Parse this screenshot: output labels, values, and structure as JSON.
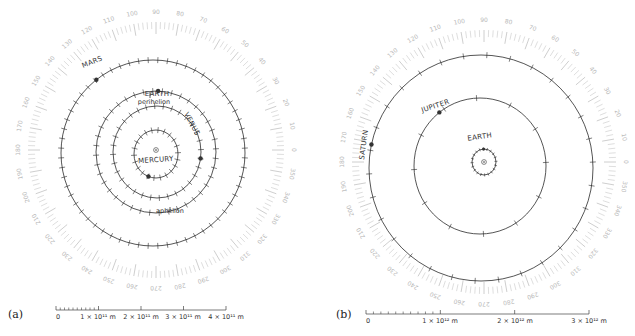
{
  "figure": {
    "panels": [
      {
        "id": "a",
        "panel_label": "(a)",
        "center": [
          156,
          150
        ],
        "degree_ring": {
          "inner_radius": 118,
          "outer_radius": 128,
          "label_radius": 138,
          "label_step_deg": 10,
          "labels": [
            "0",
            "10",
            "20",
            "30",
            "40",
            "50",
            "60",
            "70",
            "80",
            "90",
            "100",
            "110",
            "120",
            "130",
            "140",
            "150",
            "160",
            "170",
            "180",
            "190",
            "200",
            "210",
            "220",
            "230",
            "240",
            "250",
            "260",
            "270",
            "280",
            "290",
            "300",
            "310",
            "320",
            "330",
            "340",
            "350"
          ]
        },
        "orbits": [
          {
            "name": "MERCURY",
            "rx": 22,
            "ry": 24,
            "cx_off": 0,
            "cy_off": 4,
            "ticks": 22,
            "planet_angle_deg": 250,
            "label": "MERCURY",
            "label_pos": [
              156,
              162
            ]
          },
          {
            "name": "VENUS",
            "rx": 44,
            "ry": 46,
            "cx_off": 1,
            "cy_off": 2,
            "ticks": 32,
            "planet_angle_deg": -8,
            "label": "VENUS",
            "label_pos": [
              190,
              125
            ]
          },
          {
            "name": "EARTH",
            "rx": 60,
            "ry": 61,
            "cx_off": 0,
            "cy_off": 2,
            "ticks": 40,
            "planet_angle_deg": 88,
            "label": "EARTH",
            "label_pos": [
              157,
              96
            ]
          },
          {
            "name": "MARS",
            "rx": 92,
            "ry": 93,
            "cx_off": -3,
            "cy_off": 3,
            "ticks": 60,
            "planet_angle_deg": 128,
            "label": "MARS",
            "label_pos": [
              93,
              64
            ]
          }
        ],
        "annotations": [
          {
            "name": "perihelion",
            "text": "perihelion",
            "pos": [
              154,
              104
            ]
          },
          {
            "name": "aphelion",
            "text": "aphelion",
            "pos": [
              170,
              213
            ]
          }
        ],
        "sun_symbol": "⊙",
        "scale_bar": {
          "x0": 56,
          "x1": 226,
          "y": 310,
          "labels": [
            {
              "text": "0",
              "x": 56
            },
            {
              "text": "1 × 10¹¹ m",
              "x": 98
            },
            {
              "text": "2 × 10¹¹ m",
              "x": 141
            },
            {
              "text": "3 × 10¹¹ m",
              "x": 183
            },
            {
              "text": "4 × 10¹¹ m",
              "x": 226
            }
          ],
          "minor_ticks": 10,
          "major_ticks": 4
        }
      },
      {
        "id": "b",
        "panel_label": "(b)",
        "center": [
          484,
          162
        ],
        "degree_ring": {
          "inner_radius": 122,
          "outer_radius": 132,
          "label_radius": 142,
          "label_step_deg": 10,
          "labels": [
            "0",
            "10",
            "20",
            "30",
            "40",
            "50",
            "60",
            "70",
            "80",
            "90",
            "100",
            "110",
            "120",
            "130",
            "140",
            "150",
            "160",
            "170",
            "180",
            "190",
            "200",
            "210",
            "220",
            "230",
            "240",
            "250",
            "260",
            "270",
            "280",
            "290",
            "300",
            "310",
            "320",
            "330",
            "340",
            "350"
          ]
        },
        "orbits": [
          {
            "name": "EARTH",
            "rx": 12,
            "ry": 13,
            "cx_off": 0,
            "cy_off": 0,
            "ticks": 20,
            "planet_angle_deg": 92,
            "label": "EARTH",
            "label_pos": [
              480,
              139
            ]
          },
          {
            "name": "JUPITER",
            "rx": 66,
            "ry": 68,
            "cx_off": -4,
            "cy_off": 4,
            "ticks": 12,
            "planet_angle_deg": 128,
            "label": "JUPITER",
            "label_pos": [
              436,
              108
            ]
          },
          {
            "name": "SATURN",
            "rx": 112,
            "ry": 113,
            "cx_off": -3,
            "cy_off": 6,
            "ticks": 30,
            "planet_angle_deg": 168,
            "label": "SATURN",
            "label_pos": [
              366,
              145
            ]
          }
        ],
        "annotations": [],
        "sun_symbol": "⊙",
        "scale_bar": {
          "x0": 366,
          "x1": 589,
          "y": 314,
          "labels": [
            {
              "text": "0",
              "x": 366
            },
            {
              "text": "1 × 10¹² m",
              "x": 440
            },
            {
              "text": "2 × 10¹² m",
              "x": 515
            },
            {
              "text": "3 × 10¹² m",
              "x": 589
            }
          ],
          "minor_ticks": 10,
          "major_ticks": 3
        }
      }
    ],
    "colors": {
      "orbit": "#2a2a2a",
      "degree_ring": "#c8c8c8",
      "degree_text": "#b8b8b8",
      "text": "#333333",
      "background": "#ffffff"
    }
  }
}
